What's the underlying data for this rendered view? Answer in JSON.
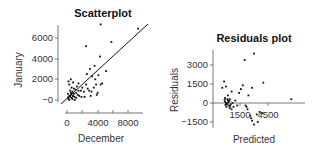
{
  "chart_data": [
    {
      "type": "scatter",
      "title": "Scatterplot",
      "xlabel": "December",
      "ylabel": "January",
      "xticks": [
        0,
        4000,
        8000
      ],
      "xtick_labels": [
        "0",
        "4000",
        "8000"
      ],
      "yticks": [
        0,
        2000,
        4000,
        6000
      ],
      "ytick_labels": [
        "−0",
        "2000",
        "4000",
        "6000"
      ],
      "xlim": [
        -1000,
        10000
      ],
      "ylim": [
        -300,
        7200
      ],
      "grid": false,
      "fit_line": {
        "x": [
          -1000,
          10000
        ],
        "y": [
          -700,
          7500
        ]
      },
      "points": [
        [
          200,
          100
        ],
        [
          400,
          300
        ],
        [
          500,
          500
        ],
        [
          300,
          0
        ],
        [
          600,
          200
        ],
        [
          800,
          400
        ],
        [
          700,
          800
        ],
        [
          900,
          600
        ],
        [
          1000,
          300
        ],
        [
          1200,
          700
        ],
        [
          1400,
          500
        ],
        [
          1500,
          900
        ],
        [
          1100,
          1000
        ],
        [
          600,
          1200
        ],
        [
          300,
          1500
        ],
        [
          500,
          2000
        ],
        [
          200,
          1800
        ],
        [
          800,
          1700
        ],
        [
          1500,
          1600
        ],
        [
          2000,
          1200
        ],
        [
          1800,
          900
        ],
        [
          2200,
          800
        ],
        [
          2500,
          1500
        ],
        [
          2600,
          2500
        ],
        [
          3000,
          3000
        ],
        [
          3300,
          2300
        ],
        [
          3700,
          2000
        ],
        [
          3800,
          1500
        ],
        [
          3500,
          1200
        ],
        [
          2900,
          900
        ],
        [
          3200,
          800
        ],
        [
          4000,
          700
        ],
        [
          4400,
          1500
        ],
        [
          4600,
          1600
        ],
        [
          5100,
          2800
        ],
        [
          4300,
          4200
        ],
        [
          3600,
          3300
        ],
        [
          2500,
          5200
        ],
        [
          4400,
          7300
        ],
        [
          5800,
          5600
        ],
        [
          9300,
          6900
        ],
        [
          4100,
          2400
        ],
        [
          2700,
          1100
        ],
        [
          1300,
          1300
        ],
        [
          100,
          600
        ],
        [
          400,
          900
        ],
        [
          700,
          100
        ],
        [
          1000,
          0
        ],
        [
          1600,
          400
        ],
        [
          1900,
          300
        ],
        [
          2300,
          300
        ],
        [
          3100,
          400
        ],
        [
          3900,
          500
        ],
        [
          600,
          600
        ],
        [
          900,
          1100
        ],
        [
          1200,
          200
        ],
        [
          300,
          400
        ],
        [
          500,
          700
        ],
        [
          150,
          250
        ],
        [
          750,
          350
        ]
      ]
    },
    {
      "type": "scatter",
      "title": "Residuals plot",
      "xlabel": "Predicted",
      "ylabel": "Residuals",
      "xtick_labels": [
        "1500",
        "4500"
      ],
      "xticks": [
        1500,
        4500
      ],
      "yticks": [
        -1500,
        0,
        1500,
        3000
      ],
      "ytick_labels": [
        "−1500",
        "0",
        "1500",
        "3000"
      ],
      "xlim": [
        -1000,
        8000
      ],
      "ylim": [
        -2000,
        4200
      ],
      "grid": false,
      "zero_line": true,
      "points": [
        [
          -200,
          1700
        ],
        [
          -400,
          1200
        ],
        [
          0,
          1300
        ],
        [
          -100,
          400
        ],
        [
          200,
          600
        ],
        [
          400,
          300
        ],
        [
          600,
          900
        ],
        [
          1000,
          200
        ],
        [
          1400,
          800
        ],
        [
          1600,
          1100
        ],
        [
          1800,
          1400
        ],
        [
          2800,
          1200
        ],
        [
          2400,
          600
        ],
        [
          3000,
          3900
        ],
        [
          2000,
          3400
        ],
        [
          4000,
          1600
        ],
        [
          2100,
          -200
        ],
        [
          2300,
          -500
        ],
        [
          2600,
          -1000
        ],
        [
          2800,
          -1400
        ],
        [
          3000,
          -1700
        ],
        [
          3300,
          -900
        ],
        [
          3600,
          -700
        ],
        [
          3900,
          -800
        ],
        [
          2700,
          -1200
        ],
        [
          3400,
          -1500
        ],
        [
          2200,
          -300
        ],
        [
          7000,
          300
        ],
        [
          1200,
          -200
        ],
        [
          0,
          0
        ],
        [
          100,
          -100
        ],
        [
          -100,
          100
        ],
        [
          200,
          200
        ],
        [
          300,
          -200
        ],
        [
          50,
          -300
        ],
        [
          150,
          300
        ],
        [
          -50,
          -150
        ],
        [
          250,
          50
        ],
        [
          400,
          -400
        ],
        [
          500,
          -100
        ],
        [
          600,
          -500
        ],
        [
          800,
          -300
        ],
        [
          700,
          0
        ],
        [
          350,
          150
        ],
        [
          450,
          -250
        ],
        [
          120,
          -50
        ],
        [
          -150,
          250
        ]
      ]
    }
  ],
  "charts": {
    "left": {
      "title": "Scatterplot",
      "xlabel": "December",
      "ylabel": "January",
      "xtick_labels": [
        "0",
        "4000",
        "8000"
      ],
      "ytick_labels": [
        "−0",
        "2000",
        "4000",
        "6000"
      ]
    },
    "right": {
      "title": "Residuals plot",
      "xlabel": "Predicted",
      "ylabel": "Residuals",
      "xtick_labels": [
        "1500",
        "4500"
      ],
      "ytick_labels": [
        "−1500",
        "0",
        "1500",
        "3000"
      ]
    }
  }
}
